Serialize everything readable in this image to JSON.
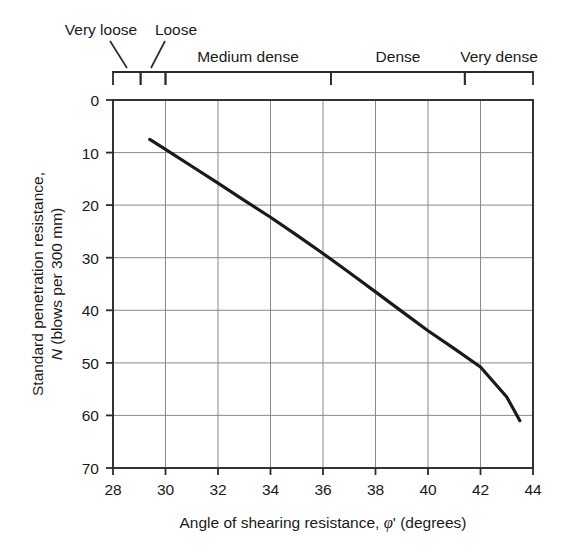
{
  "chart_data": {
    "type": "line",
    "title": "",
    "xlabel": "Angle of shearing resistance, φ' (degrees)",
    "ylabel": "Standard penetration resistance, N (blows per 300 mm)",
    "ylabel_line1": "Standard penetration resistance,",
    "ylabel_line2_prefix": "N",
    "ylabel_line2_rest": " (blows per 300 mm)",
    "xlabel_prefix": "Angle of shearing resistance, ",
    "xlabel_phi": "φ",
    "xlabel_prime": "'",
    "xlabel_suffix": " (degrees)",
    "xlim": [
      28,
      44
    ],
    "ylim": [
      0,
      70
    ],
    "y_inverted": true,
    "grid": true,
    "legend": "none",
    "xticks": [
      28,
      30,
      32,
      34,
      36,
      38,
      40,
      42,
      44
    ],
    "xtick_labels": [
      "28",
      "30",
      "32",
      "34",
      "36",
      "38",
      "40",
      "42",
      "44"
    ],
    "yticks": [
      0,
      10,
      20,
      30,
      40,
      50,
      60,
      70
    ],
    "ytick_labels": [
      "0",
      "10",
      "20",
      "30",
      "40",
      "50",
      "60",
      "70"
    ],
    "series": [
      {
        "name": "N vs phi'",
        "color": "#1a1a1a",
        "line_width": 3.2,
        "x": [
          29.4,
          30.0,
          31.0,
          32.0,
          33.0,
          34.0,
          35.0,
          36.0,
          37.0,
          38.0,
          39.0,
          40.0,
          41.0,
          42.0,
          43.0,
          43.5
        ],
        "values": [
          7.5,
          9.4,
          12.6,
          15.8,
          19.1,
          22.3,
          25.7,
          29.2,
          32.8,
          36.5,
          40.2,
          43.9,
          47.3,
          50.8,
          56.5,
          61.0
        ]
      }
    ],
    "annotations": {
      "density_bands": [
        {
          "label": "Very loose",
          "x_start": 28.0,
          "x_end": 29.05,
          "label_x": 29.3,
          "label_y_px": 33,
          "leader": true
        },
        {
          "label": "Loose",
          "x_start": 29.05,
          "x_end": 30.0,
          "label_x": 30.6,
          "label_y_px": 33,
          "leader": true
        },
        {
          "label": "Medium dense",
          "x_start": 30.0,
          "x_end": 36.3,
          "label_x": 33.15,
          "label_y_px": 58,
          "leader": false
        },
        {
          "label": "Dense",
          "x_start": 36.3,
          "x_end": 41.4,
          "label_x": 38.85,
          "label_y_px": 58,
          "leader": false
        },
        {
          "label": "Very dense",
          "x_start": 41.4,
          "x_end": 44.0,
          "label_x": 42.7,
          "label_y_px": 58,
          "leader": false
        }
      ]
    }
  },
  "colors": {
    "curve": "#1a1a1a",
    "axis": "#2b2b2b",
    "grid": "#7d7d7d",
    "text": "#1a1a1a",
    "background": "#ffffff"
  }
}
